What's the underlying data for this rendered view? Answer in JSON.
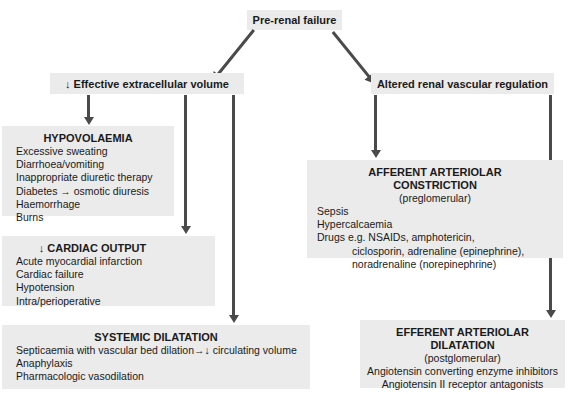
{
  "diagram": {
    "colors": {
      "box_fill": "#ebebeb",
      "arrow": "#4a4a4a",
      "text": "#1a1a1a",
      "background": "#ffffff"
    },
    "root": {
      "label": "Pre-renal failure"
    },
    "branches": [
      {
        "id": "effective-extracellular-volume",
        "label": "↓ Effective extracellular volume"
      },
      {
        "id": "altered-renal-vascular-regulation",
        "label": "Altered renal vascular regulation"
      }
    ],
    "nodes": [
      {
        "id": "hypovolaemia",
        "title": "HYPOVOLAEMIA",
        "subtitle": "",
        "items": [
          "Excessive sweating",
          "Diarrhoea/vomiting",
          "Inappropriate diuretic therapy",
          "Diabetes → osmotic diuresis",
          "Haemorrhage",
          "Burns"
        ]
      },
      {
        "id": "cardiac-output",
        "title": "↓ CARDIAC OUTPUT",
        "subtitle": "",
        "items": [
          "Acute myocardial infarction",
          "Cardiac failure",
          "Hypotension",
          "Intra/perioperative"
        ]
      },
      {
        "id": "systemic-dilatation",
        "title": "SYSTEMIC DILATATION",
        "subtitle": "",
        "items": [
          "Septicaemia with vascular bed dilation→↓ circulating volume",
          "Anaphylaxis",
          "Pharmacologic vasodilation"
        ]
      },
      {
        "id": "afferent-arteriolar-constriction",
        "title": "AFFERENT ARTERIOLAR\nCONSTRICTION",
        "subtitle": "(preglomerular)",
        "items": [
          "Sepsis",
          "Hypercalcaemia",
          "Drugs e.g. NSAIDs, amphotericin,",
          "            ciclosporin, adrenaline (epinephrine),",
          "            noradrenaline (norepinephrine)"
        ]
      },
      {
        "id": "efferent-arteriolar-dilatation",
        "title": "EFFERENT ARTERIOLAR\nDILATATION",
        "subtitle": "(postglomerular)",
        "items": [
          "Angiotensin converting enzyme inhibitors",
          "Angiotensin II receptor antagonists"
        ]
      }
    ],
    "connectors": [
      {
        "id": "root-to-left",
        "from": "root",
        "to": "effective-extracellular-volume",
        "style": "diagonal-arrow"
      },
      {
        "id": "root-to-right",
        "from": "root",
        "to": "altered-renal-vascular-regulation",
        "style": "diagonal-arrow"
      },
      {
        "id": "left-to-hypovolaemia",
        "from": "effective-extracellular-volume",
        "to": "hypovolaemia",
        "style": "vertical-arrow"
      },
      {
        "id": "left-to-cardiac-output",
        "from": "effective-extracellular-volume",
        "to": "cardiac-output",
        "style": "vertical-arrow"
      },
      {
        "id": "left-to-systemic-dilatation",
        "from": "effective-extracellular-volume",
        "to": "systemic-dilatation",
        "style": "vertical-arrow"
      },
      {
        "id": "right-to-afferent",
        "from": "altered-renal-vascular-regulation",
        "to": "afferent-arteriolar-constriction",
        "style": "vertical-arrow"
      },
      {
        "id": "right-to-efferent",
        "from": "altered-renal-vascular-regulation",
        "to": "efferent-arteriolar-dilatation",
        "style": "vertical-arrow"
      }
    ]
  }
}
